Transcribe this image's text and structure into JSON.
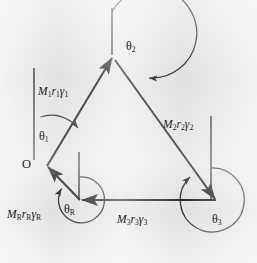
{
  "figure": {
    "kind": "vector-polygon-diagram",
    "caption_text": "",
    "background_color": "#e9e9e9",
    "ink_color": "#1b1b1b",
    "origin_label": "O",
    "vectors": [
      {
        "id": "M1",
        "label_magnitude": "M",
        "label_magnitude_sub": "1",
        "label_radius": "r",
        "label_radius_sub": "1",
        "label_gamma": "γ",
        "label_gamma_sub": "1",
        "angle_label": "θ",
        "angle_label_sub": "1",
        "from": [
          47,
          166
        ],
        "to": [
          113,
          57
        ]
      },
      {
        "id": "M2",
        "label_magnitude": "M",
        "label_magnitude_sub": "2",
        "label_radius": "r",
        "label_radius_sub": "2",
        "label_gamma": "γ",
        "label_gamma_sub": "2",
        "angle_label": "θ",
        "angle_label_sub": "2",
        "from": [
          113,
          57
        ],
        "to": [
          216,
          200
        ]
      },
      {
        "id": "M3",
        "label_magnitude": "M",
        "label_magnitude_sub": "3",
        "label_radius": "r",
        "label_radius_sub": "3",
        "label_gamma": "γ",
        "label_gamma_sub": "3",
        "angle_label": "θ",
        "angle_label_sub": "3",
        "from": [
          216,
          200
        ],
        "to": [
          80,
          200
        ]
      },
      {
        "id": "MR",
        "label_magnitude": "M",
        "label_magnitude_sub": "R",
        "label_radius": "r",
        "label_radius_sub": "R",
        "label_gamma": "γ",
        "label_gamma_sub": "R",
        "angle_label": "θ",
        "angle_label_sub": "R",
        "from": [
          80,
          200
        ],
        "to": [
          47,
          166
        ]
      }
    ],
    "reference_lines": [
      {
        "id": "ref-1",
        "x": 34,
        "y1": 68,
        "y2": 160
      },
      {
        "id": "ref-2",
        "x": 112,
        "y1": 8,
        "y2": 55
      },
      {
        "id": "ref-3",
        "x": 211,
        "y1": 116,
        "y2": 200
      },
      {
        "id": "ref-R",
        "x": 79,
        "y1": 152,
        "y2": 200
      }
    ]
  }
}
